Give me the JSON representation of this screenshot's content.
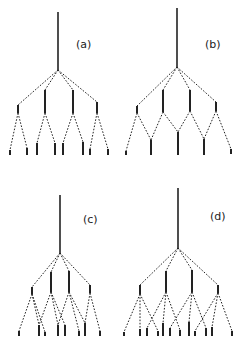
{
  "figure": {
    "panels": [
      {
        "id": "a",
        "label": "(a)",
        "label_pos": [
          76,
          38
        ],
        "root": {
          "x": 58,
          "y1": 12,
          "y2": 70
        },
        "nodes": [
          {
            "x": 18,
            "top": 105,
            "bottom": 113
          },
          {
            "x": 45,
            "top": 90,
            "bottom": 113
          },
          {
            "x": 73,
            "top": 90,
            "bottom": 113
          },
          {
            "x": 97,
            "top": 102,
            "bottom": 113
          }
        ],
        "leaves": [
          {
            "x": 10,
            "top": 150,
            "bottom": 155,
            "parent": 0
          },
          {
            "x": 27,
            "top": 148,
            "bottom": 155,
            "parent": 0
          },
          {
            "x": 37,
            "top": 143,
            "bottom": 155,
            "parent": 1
          },
          {
            "x": 55,
            "top": 143,
            "bottom": 155,
            "parent": 1
          },
          {
            "x": 63,
            "top": 143,
            "bottom": 155,
            "parent": 2
          },
          {
            "x": 83,
            "top": 142,
            "bottom": 155,
            "parent": 2
          },
          {
            "x": 90,
            "top": 149,
            "bottom": 155,
            "parent": 3
          },
          {
            "x": 108,
            "top": 149,
            "bottom": 155,
            "parent": 3
          }
        ]
      },
      {
        "id": "b",
        "label": "(b)",
        "label_pos": [
          205,
          38
        ],
        "root": {
          "x": 177,
          "y1": 8,
          "y2": 67
        },
        "nodes": [
          {
            "x": 137,
            "top": 106,
            "bottom": 113
          },
          {
            "x": 163,
            "top": 90,
            "bottom": 112
          },
          {
            "x": 190,
            "top": 90,
            "bottom": 111
          },
          {
            "x": 216,
            "top": 102,
            "bottom": 111
          }
        ],
        "leaves": [
          {
            "x": 126,
            "top": 151,
            "bottom": 155,
            "parents": [
              0
            ]
          },
          {
            "x": 151,
            "top": 140,
            "bottom": 155,
            "parents": [
              0,
              1
            ]
          },
          {
            "x": 178,
            "top": 132,
            "bottom": 155,
            "parents": [
              1,
              2
            ]
          },
          {
            "x": 204,
            "top": 139,
            "bottom": 155,
            "parents": [
              2,
              3
            ]
          },
          {
            "x": 231,
            "top": 149,
            "bottom": 154,
            "parents": [
              3
            ]
          }
        ]
      },
      {
        "id": "c",
        "label": "(c)",
        "label_pos": [
          83,
          213
        ],
        "root": {
          "x": 60,
          "y1": 195,
          "y2": 253
        },
        "nodes": [
          {
            "x": 32,
            "top": 287,
            "bottom": 294
          },
          {
            "x": 51,
            "top": 272,
            "bottom": 292
          },
          {
            "x": 69,
            "top": 271,
            "bottom": 292
          },
          {
            "x": 90,
            "top": 285,
            "bottom": 293
          }
        ],
        "leaves": [
          {
            "x": 19,
            "top": 331,
            "bottom": 336,
            "parents": [
              0
            ]
          },
          {
            "x": 39,
            "top": 325,
            "bottom": 336,
            "parents": [
              0,
              1
            ]
          },
          {
            "x": 45,
            "top": 332,
            "bottom": 336,
            "parents": [
              0
            ]
          },
          {
            "x": 58,
            "top": 325,
            "bottom": 336,
            "parents": [
              1,
              2
            ]
          },
          {
            "x": 65,
            "top": 325,
            "bottom": 336,
            "parents": [
              1
            ]
          },
          {
            "x": 79,
            "top": 331,
            "bottom": 336,
            "parents": [
              2
            ]
          },
          {
            "x": 85,
            "top": 323,
            "bottom": 336,
            "parents": [
              2,
              3
            ]
          },
          {
            "x": 100,
            "top": 331,
            "bottom": 336,
            "parents": [
              3
            ]
          }
        ]
      },
      {
        "id": "d",
        "label": "(d)",
        "label_pos": [
          210,
          210
        ],
        "root": {
          "x": 178,
          "y1": 188,
          "y2": 248
        },
        "nodes": [
          {
            "x": 140,
            "top": 285,
            "bottom": 294
          },
          {
            "x": 166,
            "top": 271,
            "bottom": 292
          },
          {
            "x": 192,
            "top": 270,
            "bottom": 292
          },
          {
            "x": 218,
            "top": 285,
            "bottom": 293
          }
        ],
        "leaves": [
          {
            "x": 124,
            "top": 332,
            "bottom": 336,
            "parents": [
              0
            ]
          },
          {
            "x": 140,
            "top": 329,
            "bottom": 336,
            "parents": [
              0
            ]
          },
          {
            "x": 147,
            "top": 328,
            "bottom": 336,
            "parents": [
              1
            ]
          },
          {
            "x": 158,
            "top": 331,
            "bottom": 336,
            "parents": [
              0
            ]
          },
          {
            "x": 163,
            "top": 323,
            "bottom": 336,
            "parents": [
              1
            ]
          },
          {
            "x": 170,
            "top": 328,
            "bottom": 336,
            "parents": [
              2
            ]
          },
          {
            "x": 180,
            "top": 330,
            "bottom": 336,
            "parents": [
              1
            ]
          },
          {
            "x": 189,
            "top": 322,
            "bottom": 336,
            "parents": [
              2
            ]
          },
          {
            "x": 195,
            "top": 331,
            "bottom": 336,
            "parents": [
              3
            ]
          },
          {
            "x": 206,
            "top": 328,
            "bottom": 336,
            "parents": [
              2
            ]
          },
          {
            "x": 212,
            "top": 327,
            "bottom": 336,
            "parents": [
              3
            ]
          },
          {
            "x": 232,
            "top": 331,
            "bottom": 336,
            "parents": [
              3
            ]
          }
        ]
      }
    ]
  }
}
